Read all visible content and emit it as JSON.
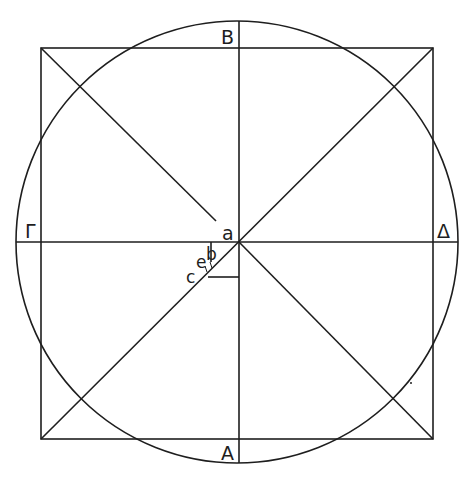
{
  "diagram": {
    "type": "geometric-construction",
    "labels": {
      "top": "B",
      "bottom": "A",
      "left": "Γ",
      "right": "Δ",
      "center": "a",
      "point_b": "b",
      "point_e": "e",
      "point_c": "c"
    },
    "circle": {
      "cx": 237,
      "cy": 242,
      "r": 221
    },
    "square": {
      "x": 41,
      "y": 48,
      "width": 392,
      "height": 391
    },
    "colors": {
      "stroke": "#1e1e1e",
      "background": "#ffffff"
    }
  }
}
